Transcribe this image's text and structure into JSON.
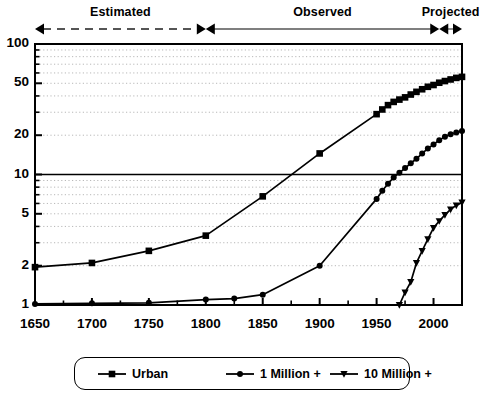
{
  "chart_data": {
    "type": "line",
    "title": "",
    "subtitle": "",
    "xlabel": "",
    "ylabel": "",
    "xlim": [
      1650,
      2025
    ],
    "ylim": [
      1,
      100
    ],
    "yscale": "log",
    "grid": true,
    "legend_position": "bottom",
    "x_ticks": [
      1650,
      1700,
      1750,
      1800,
      1850,
      1900,
      1950,
      2000
    ],
    "x_minor_tick_interval": 25,
    "y_ticks": [
      1,
      2,
      5,
      10,
      20,
      50,
      100
    ],
    "reference_line_y": 10,
    "annotations": [
      {
        "label": "Estimated",
        "start": 1650,
        "end": 1800,
        "line_style": "dashed"
      },
      {
        "label": "Observed",
        "start": 1800,
        "end": 2005,
        "line_style": "solid"
      },
      {
        "label": "Projected",
        "start": 2005,
        "end": 2025,
        "line_style": "solid"
      }
    ],
    "series": [
      {
        "name": "Urban",
        "marker": "square",
        "points": [
          [
            1650,
            1.95
          ],
          [
            1700,
            2.1
          ],
          [
            1750,
            2.6
          ],
          [
            1800,
            3.4
          ],
          [
            1850,
            6.8
          ],
          [
            1900,
            14.5
          ],
          [
            1950,
            29.0
          ],
          [
            1955,
            31.5
          ],
          [
            1960,
            34.0
          ],
          [
            1965,
            36.0
          ],
          [
            1970,
            37.5
          ],
          [
            1975,
            39.0
          ],
          [
            1980,
            41.0
          ],
          [
            1985,
            43.0
          ],
          [
            1990,
            45.0
          ],
          [
            1995,
            47.0
          ],
          [
            2000,
            48.5
          ],
          [
            2005,
            50.5
          ],
          [
            2010,
            52.0
          ],
          [
            2015,
            53.5
          ],
          [
            2020,
            55.0
          ],
          [
            2025,
            56.0
          ]
        ]
      },
      {
        "name": "1 Million +",
        "marker": "circle",
        "points": [
          [
            1650,
            1.02
          ],
          [
            1700,
            1.03
          ],
          [
            1750,
            1.04
          ],
          [
            1800,
            1.1
          ],
          [
            1825,
            1.12
          ],
          [
            1850,
            1.2
          ],
          [
            1900,
            2.0
          ],
          [
            1950,
            6.5
          ],
          [
            1955,
            7.5
          ],
          [
            1960,
            8.5
          ],
          [
            1965,
            9.5
          ],
          [
            1970,
            10.3
          ],
          [
            1975,
            11.2
          ],
          [
            1980,
            12.2
          ],
          [
            1985,
            13.2
          ],
          [
            1990,
            14.5
          ],
          [
            1995,
            15.8
          ],
          [
            2000,
            17.0
          ],
          [
            2005,
            18.3
          ],
          [
            2010,
            19.5
          ],
          [
            2015,
            20.3
          ],
          [
            2020,
            21.0
          ],
          [
            2025,
            21.5
          ]
        ]
      },
      {
        "name": "10 Million +",
        "marker": "triangle-down",
        "points": [
          [
            1970,
            1.0
          ],
          [
            1975,
            1.25
          ],
          [
            1980,
            1.5
          ],
          [
            1985,
            2.1
          ],
          [
            1990,
            2.6
          ],
          [
            1995,
            3.2
          ],
          [
            2000,
            3.9
          ],
          [
            2005,
            4.4
          ],
          [
            2010,
            4.9
          ],
          [
            2015,
            5.4
          ],
          [
            2020,
            5.8
          ],
          [
            2025,
            6.1
          ]
        ]
      }
    ]
  },
  "legend": {
    "items": [
      {
        "label": "Urban",
        "marker": "square"
      },
      {
        "label": "1 Million +",
        "marker": "circle"
      },
      {
        "label": "10 Million +",
        "marker": "triangle-down"
      }
    ]
  },
  "colors": {
    "line": "#000000",
    "grid": "#b8b8b8",
    "axis": "#000000",
    "background": "#ffffff"
  }
}
